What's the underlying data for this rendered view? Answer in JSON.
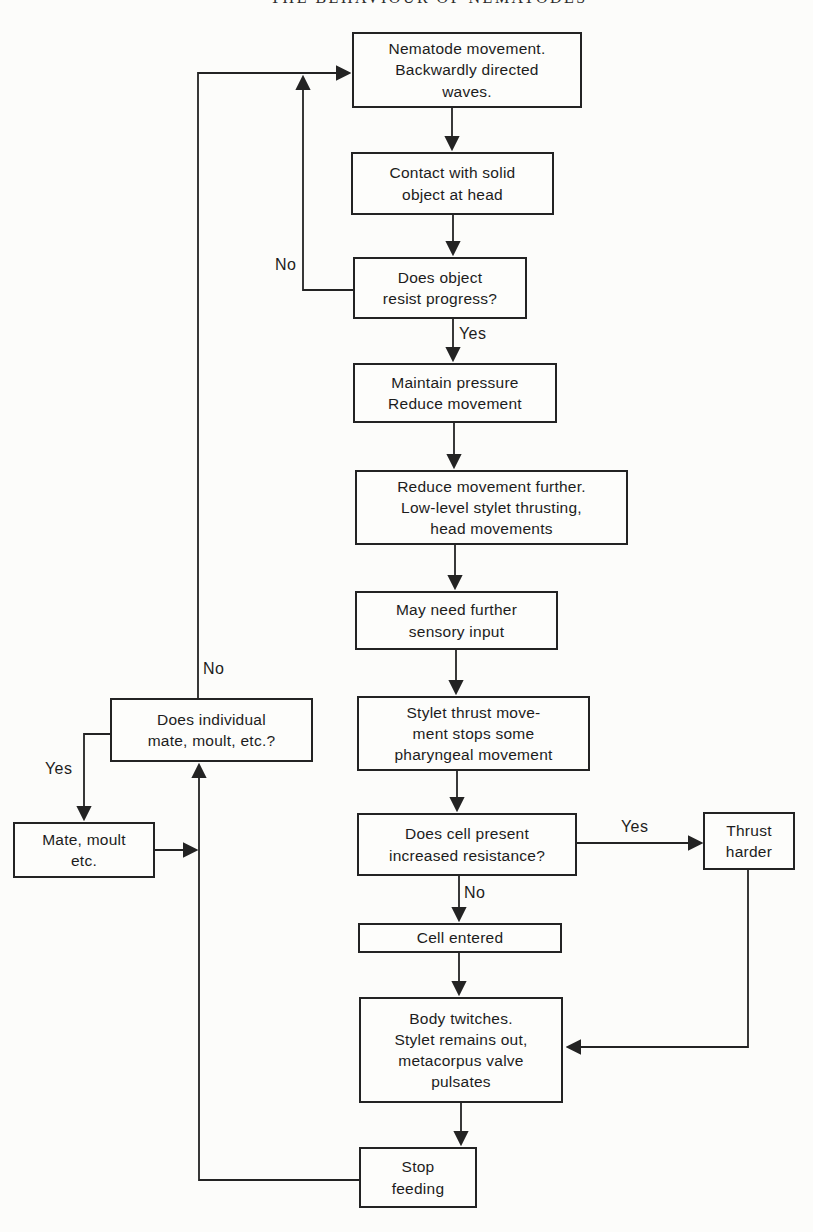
{
  "page_header": "THE BEHAVIOUR OF NEMATODES",
  "nodes": {
    "nematode": "Nematode movement.\nBackwardly directed\nwaves.",
    "contact": "Contact with solid\nobject at head",
    "resist": "Does object\nresist progress?",
    "maintain": "Maintain pressure\nReduce movement",
    "reduce": "Reduce movement further.\nLow-level stylet thrusting,\nhead movements",
    "sensory": "May need further\nsensory input",
    "stylet": "Stylet thrust move-\nment stops some\npharyngeal movement",
    "cellresist": "Does cell present\nincreased resistance?",
    "thrust": "Thrust\nharder",
    "entered": "Cell entered",
    "twitches": "Body twitches.\nStylet remains out,\nmetacorpus valve\npulsates",
    "stop": "Stop\nfeeding",
    "individual": "Does individual\nmate, moult, etc.?",
    "mate": "Mate, moult\netc."
  },
  "labels": {
    "yes_resist": "Yes",
    "no_resist": "No",
    "yes_cell": "Yes",
    "no_cell": "No",
    "no_individual": "No",
    "yes_individual": "Yes"
  },
  "colors": {
    "ink": "#1c1c1c",
    "paper": "#fcfcfa"
  }
}
